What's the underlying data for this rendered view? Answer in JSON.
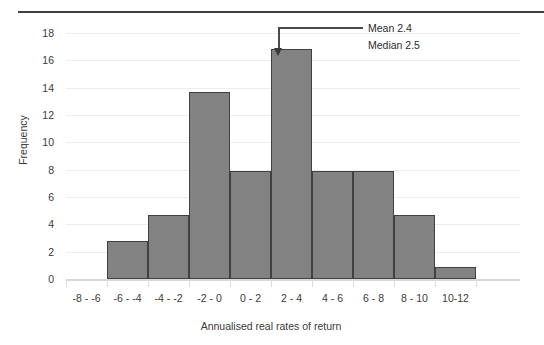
{
  "chart_data": {
    "type": "bar",
    "title": "",
    "xlabel": "Annualised real rates of return",
    "ylabel": "Frequency",
    "categories": [
      "-8 - -6",
      "-6 - -4",
      "-4 - -2",
      "-2 - 0",
      "0 - 2",
      "2 - 4",
      "4 - 6",
      "6 - 8",
      "8 - 10",
      "10-12"
    ],
    "values": [
      0,
      2.8,
      4.7,
      13.7,
      7.9,
      16.8,
      7.9,
      7.9,
      4.7,
      0.9
    ],
    "ylim": [
      0,
      18
    ],
    "yticks": [
      0,
      2,
      4,
      6,
      8,
      10,
      12,
      14,
      16,
      18
    ],
    "ytick_labels": [
      "0",
      "2",
      "4",
      "6",
      "8",
      "10",
      "12",
      "14",
      "16",
      "18"
    ],
    "grid": true,
    "legend": false,
    "bar_color": "#828282",
    "bar_edge_color": "#3f4042",
    "grid_color": "#ededee",
    "annotations": [
      {
        "text": "Mean 2.4",
        "value": 2.4
      },
      {
        "text": "Median 2.5",
        "value": 2.5
      }
    ]
  },
  "axes": {
    "y_title": "Frequency",
    "x_title": "Annualised real rates of return"
  }
}
